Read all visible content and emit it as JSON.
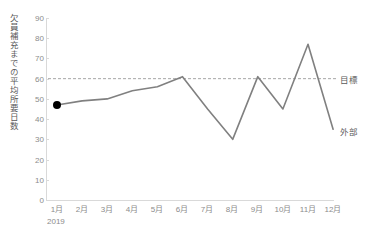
{
  "chart_data": {
    "type": "line",
    "title": "",
    "xlabel": "",
    "ylabel": "欠員補充までの平均所要日数",
    "period_label": "2019",
    "categories": [
      "1月",
      "2月",
      "3月",
      "4月",
      "5月",
      "6月",
      "7月",
      "8月",
      "9月",
      "10月",
      "11月",
      "12月"
    ],
    "ytick_labels": [
      "0",
      "10",
      "20",
      "30",
      "40",
      "50",
      "60",
      "70",
      "80",
      "90"
    ],
    "ytick_values": [
      0,
      10,
      20,
      30,
      40,
      50,
      60,
      70,
      80,
      90
    ],
    "ylim": [
      0,
      90
    ],
    "grid": false,
    "legend_position": "right-inline",
    "series": [
      {
        "name": "外部",
        "style": "solid",
        "color": "#808080",
        "values": [
          47,
          49,
          50,
          54,
          56,
          61,
          45,
          30,
          61,
          45,
          77,
          35
        ],
        "marker_points": [
          {
            "category": "1月",
            "value": 47,
            "color": "#000000"
          }
        ]
      },
      {
        "name": "目標",
        "style": "dashed",
        "color": "#a6a6a6",
        "constant_value": 60
      }
    ],
    "annotations": [
      {
        "name": "目標",
        "value": 60
      },
      {
        "name": "外部",
        "value": 35
      }
    ]
  },
  "labels": {
    "target": "目標",
    "external": "外部"
  }
}
